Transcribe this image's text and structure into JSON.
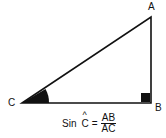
{
  "diagram": {
    "type": "right-triangle",
    "vertices": {
      "A": {
        "label": "A",
        "x": 151,
        "y": 17
      },
      "B": {
        "label": "B",
        "x": 151,
        "y": 103
      },
      "C": {
        "label": "C",
        "x": 22,
        "y": 103
      }
    },
    "right_angle_at": "B",
    "marked_angle_at": "C",
    "formula": {
      "func": "Sin",
      "angle": "C",
      "hat": "^",
      "equals": "=",
      "numerator": "AB",
      "denominator": "AC"
    }
  }
}
